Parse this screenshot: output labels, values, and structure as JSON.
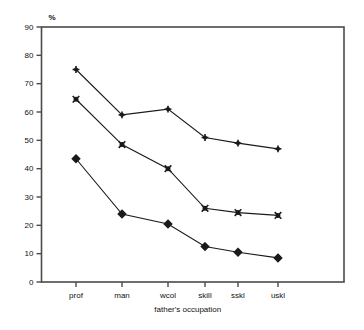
{
  "chart_data": {
    "type": "line",
    "title": "",
    "subtitle": "",
    "xlabel": "father's occupation",
    "ylabel": "%",
    "categories": [
      "prof",
      "man",
      "wcol",
      "skill",
      "sskl",
      "uskl"
    ],
    "ylim": [
      0,
      90
    ],
    "yticks": [
      0,
      10,
      20,
      30,
      40,
      50,
      60,
      70,
      80,
      90
    ],
    "ytick_labels": [
      "0",
      "10",
      "20",
      "30",
      "40",
      "50",
      "60",
      "70",
      "80",
      "90"
    ],
    "grid": false,
    "legend": "none",
    "series": [
      {
        "name": "series-plus",
        "marker": "plus",
        "values": [
          75,
          59,
          61,
          51,
          49,
          47
        ]
      },
      {
        "name": "series-cross",
        "marker": "cross",
        "values": [
          64.5,
          48.5,
          40,
          26,
          24.5,
          23.5
        ]
      },
      {
        "name": "series-diamond",
        "marker": "diamond",
        "values": [
          43.5,
          24,
          20.5,
          12.5,
          10.5,
          8.5
        ]
      }
    ],
    "colors": {
      "line": "#1a1a1a",
      "marker": "#1a1a1a",
      "frame": "#4a4a4a",
      "background": "#ffffff"
    }
  }
}
